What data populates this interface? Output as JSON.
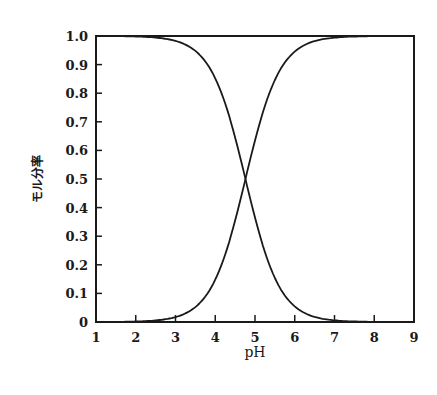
{
  "chart_data": {
    "type": "line",
    "title": "",
    "xlabel": "pH",
    "ylabel": "モル分率",
    "xlim": [
      1,
      9
    ],
    "ylim": [
      0,
      1.0
    ],
    "x_ticks": [
      "1",
      "2",
      "3",
      "4",
      "5",
      "6",
      "7",
      "8",
      "9"
    ],
    "y_ticks": [
      "0",
      "0.1",
      "0.2",
      "0.3",
      "0.4",
      "0.5",
      "0.6",
      "0.7",
      "0.8",
      "0.9",
      "1.0"
    ],
    "grid": false,
    "legend": null,
    "annotations": [],
    "crossing_point": {
      "x": 4.76,
      "y": 0.5
    },
    "x": [
      1.0,
      1.5,
      2.0,
      2.5,
      3.0,
      3.25,
      3.5,
      3.75,
      4.0,
      4.25,
      4.5,
      4.76,
      5.0,
      5.25,
      5.5,
      5.75,
      6.0,
      6.5,
      7.0,
      7.5,
      8.0,
      8.5,
      9.0
    ],
    "series": [
      {
        "name": "decreasing (acid form)",
        "values": [
          1.0,
          0.999,
          0.998,
          0.995,
          0.983,
          0.97,
          0.948,
          0.911,
          0.852,
          0.764,
          0.645,
          0.5,
          0.365,
          0.245,
          0.154,
          0.093,
          0.054,
          0.018,
          0.006,
          0.002,
          0.001,
          0.0,
          0.0
        ]
      },
      {
        "name": "increasing (base form)",
        "values": [
          0.0,
          0.001,
          0.002,
          0.005,
          0.017,
          0.03,
          0.052,
          0.089,
          0.148,
          0.236,
          0.355,
          0.5,
          0.635,
          0.755,
          0.846,
          0.907,
          0.946,
          0.982,
          0.994,
          0.998,
          0.999,
          1.0,
          1.0
        ]
      }
    ]
  },
  "labels": {
    "xlabel": "pH",
    "ylabel": "モル分率"
  },
  "colors": {
    "line": "#1a1a1a",
    "background": "#ffffff"
  }
}
